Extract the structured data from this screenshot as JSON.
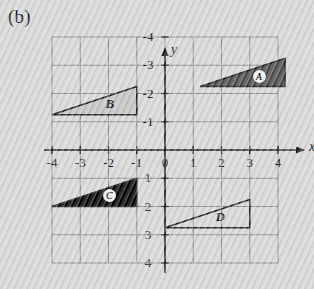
{
  "panel": {
    "label": "(b)"
  },
  "axes": {
    "x_name": "x",
    "y_name": "y",
    "x_ticks": [
      "-4",
      "-3",
      "-2",
      "-1",
      "0",
      "1",
      "2",
      "3",
      "4"
    ],
    "y_ticks": [
      "4",
      "3",
      "2",
      "1",
      "-1",
      "-2",
      "-3",
      "-4"
    ]
  },
  "colors": {
    "background": "#d6d6d6",
    "grid": "#8a8a8a",
    "axis": "#1a1a1a",
    "triangle_a_fill": "#4a4a4a",
    "triangle_b_fill": "#c2c2c2",
    "triangle_c_fill": "#000000",
    "triangle_d_fill": "none",
    "outline": "#1a1a1a"
  },
  "chart_data": {
    "type": "scatter",
    "title": "",
    "xlabel": "x",
    "ylabel": "y",
    "xlim": [
      -4,
      4
    ],
    "ylim": [
      -4,
      4
    ],
    "xticks": [
      -4,
      -3,
      -2,
      -1,
      0,
      1,
      2,
      3,
      4
    ],
    "yticks": [
      -4,
      -3,
      -2,
      -1,
      1,
      2,
      3,
      4
    ],
    "grid": true,
    "legend": "none",
    "shapes": [
      {
        "name": "A",
        "label": "A",
        "label_style": "circled",
        "fill": "#4a4a4a",
        "vertices": [
          [
            1.25,
            2.25
          ],
          [
            4.25,
            2.25
          ],
          [
            4.25,
            3.25
          ]
        ],
        "label_pos": [
          3.35,
          2.6
        ]
      },
      {
        "name": "B",
        "label": "B",
        "label_style": "plain",
        "fill": "#c2c2c2",
        "vertices": [
          [
            -4.0,
            1.25
          ],
          [
            -1.0,
            1.25
          ],
          [
            -1.0,
            2.25
          ]
        ],
        "label_pos": [
          -1.95,
          1.62
        ]
      },
      {
        "name": "C",
        "label": "C",
        "label_style": "circled",
        "fill": "#000000",
        "vertices": [
          [
            -4.0,
            -2.0
          ],
          [
            -1.0,
            -2.0
          ],
          [
            -1.0,
            -1.0
          ]
        ],
        "label_pos": [
          -1.95,
          -1.62
        ]
      },
      {
        "name": "D",
        "label": "D",
        "label_style": "plain",
        "fill": "none",
        "vertices": [
          [
            0.0,
            -2.75
          ],
          [
            3.0,
            -2.75
          ],
          [
            3.0,
            -1.75
          ]
        ],
        "label_pos": [
          1.95,
          -2.38
        ]
      }
    ]
  }
}
